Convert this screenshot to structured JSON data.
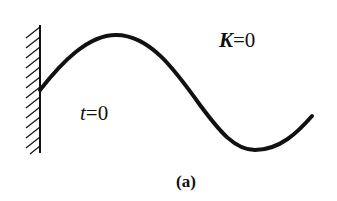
{
  "diagram": {
    "labels": {
      "k_var": "K",
      "k_eq": "=0",
      "t_var": "t",
      "t_eq": "=0",
      "caption": "(a)"
    },
    "elements": {
      "wall": "fixed wall with hatching on left side",
      "wave": "sinusoidal string/wave attached to wall, one crest and one trough"
    },
    "colors": {
      "ink": "#111111",
      "background": "#ffffff"
    }
  }
}
